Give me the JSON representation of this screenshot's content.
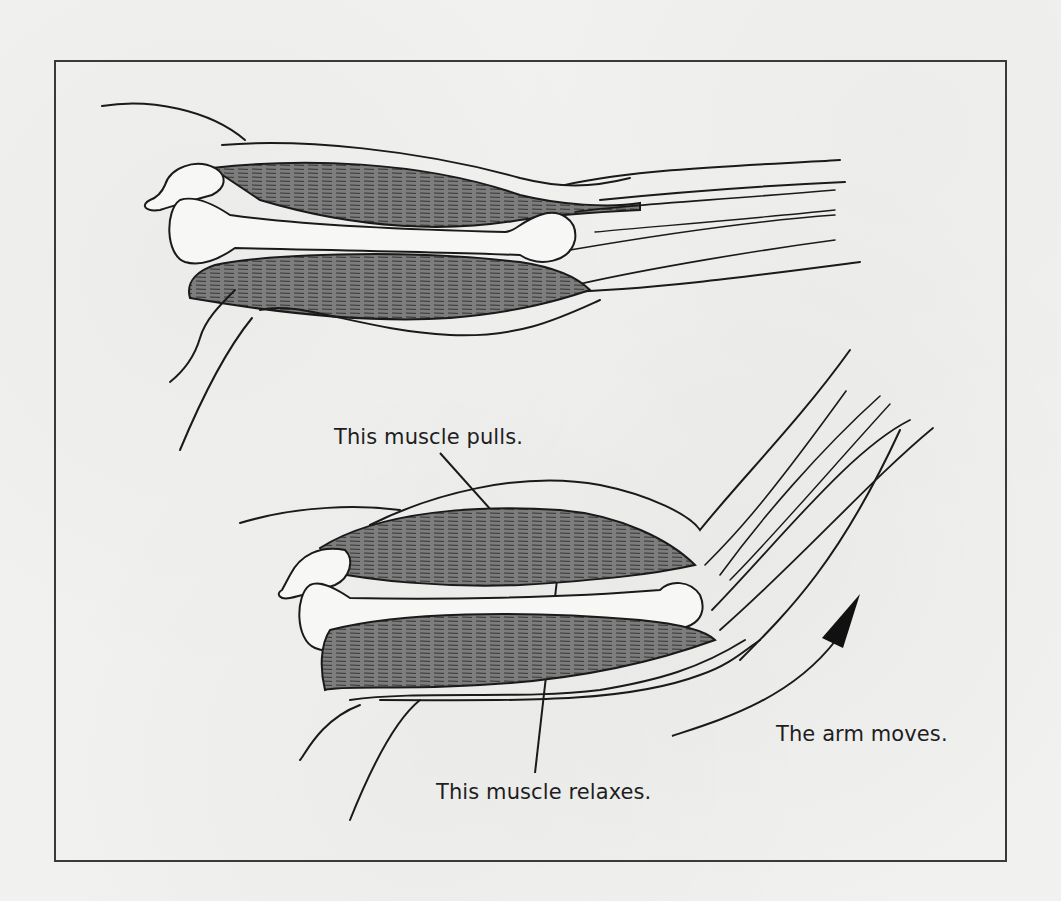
{
  "figure": {
    "colors": {
      "paper": "#f1f1f0",
      "ink": "#1a1a1a",
      "muscle": "#7d7d7d",
      "bone": "#f7f7f5",
      "frame": "#3a3a3a"
    },
    "panels": [
      {
        "name": "arm-straight",
        "description": "Extended arm showing biceps and triceps"
      },
      {
        "name": "arm-bent",
        "description": "Flexed arm with biceps contracted"
      }
    ],
    "labels": {
      "pulls": "This muscle pulls.",
      "relaxes": "This muscle relaxes.",
      "moves": "The arm moves."
    },
    "icons": {
      "motion_arrow": "curved-arrow-up-right"
    }
  }
}
